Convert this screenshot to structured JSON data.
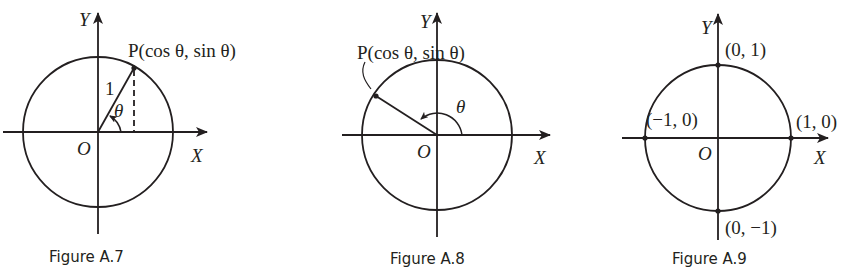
{
  "figures": [
    {
      "caption": "Figure A.7",
      "y_label": "Y",
      "x_label": "X",
      "origin_label": "O",
      "point_label": "P(cos θ,  sin θ)",
      "radius_label": "1",
      "angle_label": "θ"
    },
    {
      "caption": "Figure A.8",
      "y_label": "Y",
      "x_label": "X",
      "origin_label": "O",
      "point_label": "P(cos θ,  sin θ)",
      "angle_label": "θ"
    },
    {
      "caption": "Figure A.9",
      "y_label": "Y",
      "x_label": "X",
      "origin_label": "O",
      "points": [
        "(0, 1)",
        "(−1, 0)",
        "(1, 0)",
        "(0, −1)"
      ]
    }
  ],
  "colors": {
    "ink": "#231f20",
    "background": "#ffffff"
  }
}
